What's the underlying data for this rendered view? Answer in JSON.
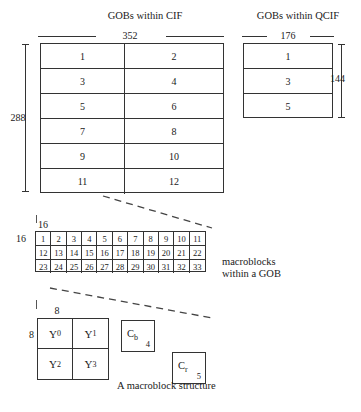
{
  "figure": {
    "caption_macroblock": "A macroblock structure",
    "note_macroblocks": {
      "line1": "macroblocks",
      "line2": "within a GOB"
    }
  },
  "cif": {
    "title": "GOBs within CIF",
    "width_label": "352",
    "height_label": "288",
    "columns": 2,
    "rows": 6,
    "gobs": [
      [
        "1",
        "2"
      ],
      [
        "3",
        "4"
      ],
      [
        "5",
        "6"
      ],
      [
        "7",
        "8"
      ],
      [
        "9",
        "10"
      ],
      [
        "11",
        "12"
      ]
    ]
  },
  "qcif": {
    "title": "GOBs within QCIF",
    "width_label": "176",
    "height_label": "144",
    "columns": 1,
    "rows": 3,
    "gobs": [
      [
        "1"
      ],
      [
        "3"
      ],
      [
        "5"
      ]
    ]
  },
  "gob_detail": {
    "width_label": "16",
    "height_label": "16",
    "columns": 11,
    "rows": 3,
    "macroblocks": [
      [
        "1",
        "2",
        "3",
        "4",
        "5",
        "6",
        "7",
        "8",
        "9",
        "10",
        "11"
      ],
      [
        "12",
        "13",
        "14",
        "15",
        "16",
        "17",
        "18",
        "19",
        "20",
        "21",
        "22"
      ],
      [
        "23",
        "24",
        "25",
        "26",
        "27",
        "28",
        "29",
        "30",
        "31",
        "32",
        "33"
      ]
    ]
  },
  "macroblock": {
    "width_label": "8",
    "height_label": "8",
    "luma_blocks": [
      {
        "label": "Y",
        "index": "0"
      },
      {
        "label": "Y",
        "index": "1"
      },
      {
        "label": "Y",
        "index": "2"
      },
      {
        "label": "Y",
        "index": "3"
      }
    ],
    "chroma_blocks": [
      {
        "label": "C",
        "sub": "b",
        "index": "4"
      },
      {
        "label": "C",
        "sub": "r",
        "index": "5"
      }
    ]
  },
  "colors": {
    "line": "#333333",
    "text": "#1a1a1a",
    "background": "#ffffff"
  }
}
